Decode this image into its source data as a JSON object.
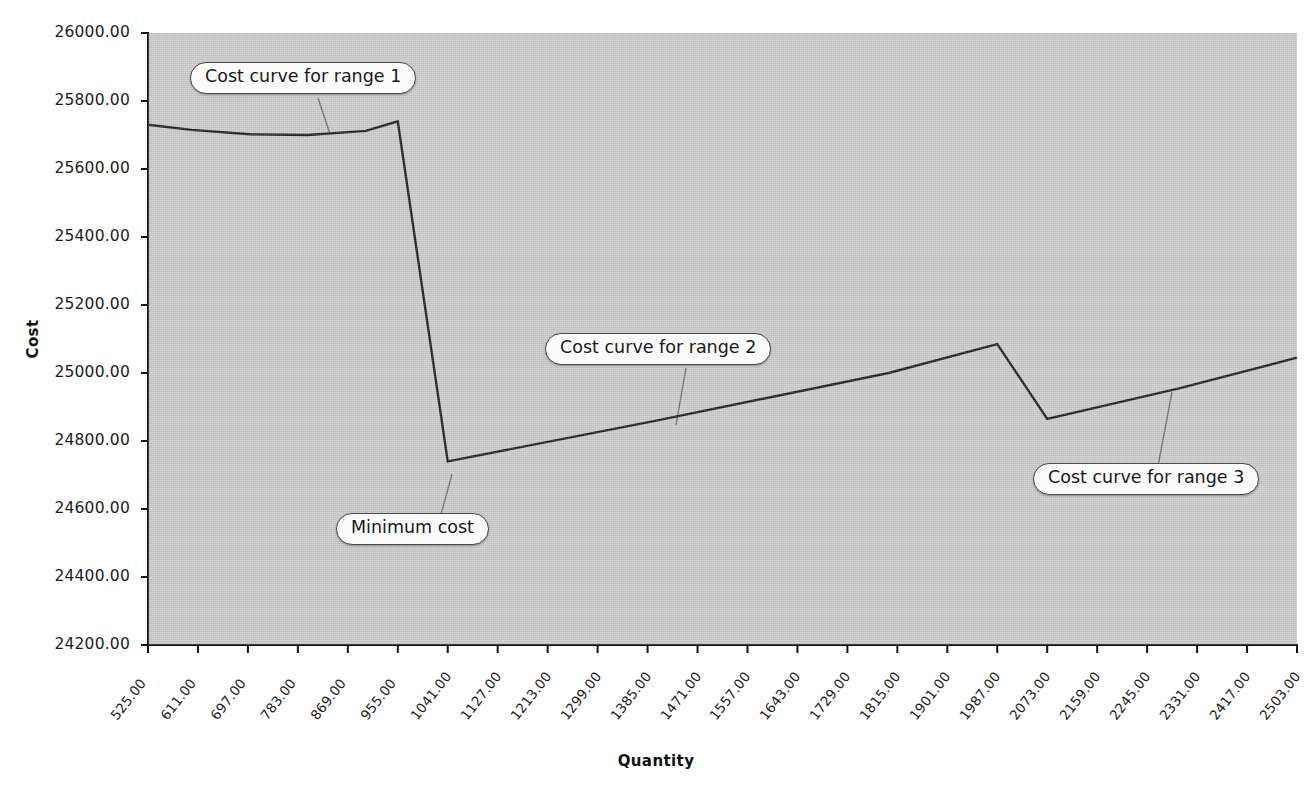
{
  "chart_data": {
    "type": "line",
    "title": "",
    "xlabel": "Quantity",
    "ylabel": "Cost",
    "xlim": [
      525,
      2503
    ],
    "ylim": [
      24200,
      26000
    ],
    "ytick_step": 200,
    "xtick_step": 86,
    "grid": false,
    "legend": "none",
    "xticks": [
      "525.00",
      "611.00",
      "697.00",
      "783.00",
      "869.00",
      "955.00",
      "1041.00",
      "1127.00",
      "1213.00",
      "1299.00",
      "1385.00",
      "1471.00",
      "1557.00",
      "1643.00",
      "1729.00",
      "1815.00",
      "1901.00",
      "1987.00",
      "2073.00",
      "2159.00",
      "2245.00",
      "2331.00",
      "2417.00",
      "2503.00"
    ],
    "yticks": [
      "24200.00",
      "24400.00",
      "24600.00",
      "24800.00",
      "25000.00",
      "25200.00",
      "25400.00",
      "25600.00",
      "25800.00",
      "26000.00"
    ],
    "series": [
      {
        "name": "Total cost",
        "segments": [
          {
            "label": "range 1",
            "x": [
              525,
              600,
              700,
              800,
              900,
              955
            ],
            "y": [
              25730,
              25715,
              25702,
              25700,
              25712,
              25740
            ]
          },
          {
            "label": "range 2",
            "x": [
              955,
              1041,
              1400,
              1800,
              1987
            ],
            "y": [
              25740,
              24740,
              24860,
              25000,
              25085
            ]
          },
          {
            "label": "range 3",
            "x": [
              1987,
              2073,
              2300,
              2503
            ],
            "y": [
              25085,
              24865,
              24955,
              25045
            ]
          }
        ]
      }
    ],
    "annotations": [
      {
        "id": "range1",
        "text": "Cost curve for range 1"
      },
      {
        "id": "range2",
        "text": "Cost curve for range 2"
      },
      {
        "id": "range3",
        "text": "Cost curve for range 3"
      },
      {
        "id": "minimum",
        "text": "Minimum cost"
      }
    ],
    "colors": {
      "plot_background": "#c9c9c9",
      "page_background": "#ffffff",
      "line": "#1a1a1a",
      "axis": "#141414",
      "callout_fill": "#fbfbfb",
      "callout_border": "#4a4a4a",
      "leader_line": "#6e6e6e"
    }
  }
}
